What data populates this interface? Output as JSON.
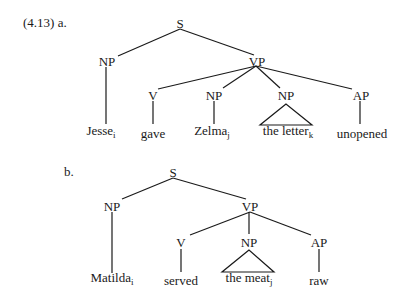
{
  "example_number": "(4.13)",
  "trees": [
    {
      "label": "a.",
      "nodes": {
        "S": "S",
        "NP_subj": "NP",
        "VP": "VP",
        "V": "V",
        "NP_obj1": "NP",
        "NP_obj2": "NP",
        "AP": "AP"
      },
      "leaves": {
        "subj": {
          "word": "Jesse",
          "index": "i"
        },
        "verb": {
          "word": "gave",
          "index": ""
        },
        "obj1": {
          "word": "Zelma",
          "index": "j"
        },
        "obj2": {
          "word": "the letter",
          "index": "k"
        },
        "ap": {
          "word": "unopened",
          "index": ""
        }
      }
    },
    {
      "label": "b.",
      "nodes": {
        "S": "S",
        "NP_subj": "NP",
        "VP": "VP",
        "V": "V",
        "NP_obj": "NP",
        "AP": "AP"
      },
      "leaves": {
        "subj": {
          "word": "Matilda",
          "index": "i"
        },
        "verb": {
          "word": "served",
          "index": ""
        },
        "obj": {
          "word": "the meat",
          "index": "j"
        },
        "ap": {
          "word": "raw",
          "index": ""
        }
      }
    }
  ],
  "colors": {
    "ink": "#1a1a1a",
    "background": "#ffffff"
  }
}
